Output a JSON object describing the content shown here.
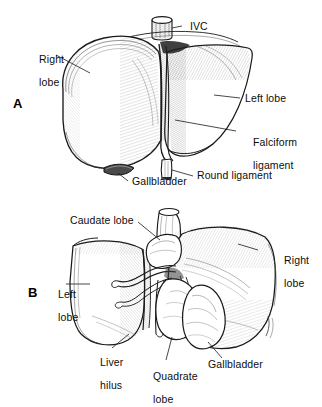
{
  "figure": {
    "background_color": "#ffffff",
    "ink_color": "#1a1a1a",
    "width": 322,
    "height": 394
  },
  "panels": [
    {
      "letter": "A",
      "caption": "Anterior (diaphragmatic) surface of the liver",
      "labels": [
        {
          "id": "ivc",
          "text": "IVC",
          "lines": [
            "IVC"
          ]
        },
        {
          "id": "right-lobe",
          "text": "Right lobe",
          "lines": [
            "Right",
            "lobe"
          ]
        },
        {
          "id": "left-lobe",
          "text": "Left lobe",
          "lines": [
            "Left lobe"
          ]
        },
        {
          "id": "falciform-ligament",
          "text": "Falciform ligament",
          "lines": [
            "Falciform",
            "ligament"
          ]
        },
        {
          "id": "round-ligament",
          "text": "Round ligament",
          "lines": [
            "Round ligament"
          ]
        },
        {
          "id": "gallbladder",
          "text": "Gallbladder",
          "lines": [
            "Gallbladder"
          ]
        }
      ]
    },
    {
      "letter": "B",
      "caption": "Posterior (visceral) surface of the liver",
      "labels": [
        {
          "id": "caudate-lobe",
          "text": "Caudate lobe",
          "lines": [
            "Caudate lobe"
          ]
        },
        {
          "id": "right-lobe-b",
          "text": "Right lobe",
          "lines": [
            "Right",
            "lobe"
          ]
        },
        {
          "id": "left-lobe-b",
          "text": "Left lobe",
          "lines": [
            "Left",
            "lobe"
          ]
        },
        {
          "id": "liver-hilus",
          "text": "Liver hilus",
          "lines": [
            "Liver",
            "hilus"
          ]
        },
        {
          "id": "quadrate-lobe",
          "text": "Quadrate lobe",
          "lines": [
            "Quadrate",
            "lobe"
          ]
        },
        {
          "id": "gallbladder-b",
          "text": "Gallbladder",
          "lines": [
            "Gallbladder"
          ]
        }
      ]
    }
  ]
}
